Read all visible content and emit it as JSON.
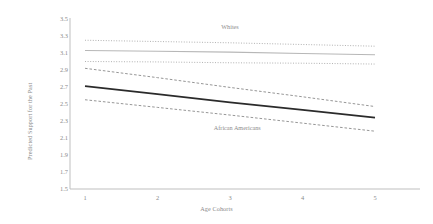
{
  "chart_data": {
    "type": "line",
    "title": "",
    "subtitle": "",
    "xlabel": "Age Cohorts",
    "ylabel": "Predicted Support for the Past",
    "x": [
      1,
      2,
      3,
      4,
      5
    ],
    "xtick_labels": [
      "1",
      "2",
      "3",
      "4",
      "5"
    ],
    "xlim": [
      0.6,
      5.4
    ],
    "ylim": [
      1.5,
      3.5
    ],
    "ytick_labels": [
      "3.5",
      "3.3",
      "3.1",
      "2.9",
      "2.7",
      "2.5",
      "2.3",
      "2.1",
      "1.9",
      "1.7",
      "1.5"
    ],
    "ytick_values": [
      3.5,
      3.3,
      3.1,
      2.9,
      2.7,
      2.5,
      2.3,
      2.1,
      1.9,
      1.7,
      1.5
    ],
    "grid": false,
    "legend_position": "inline-annotations",
    "series": [
      {
        "name": "Whites",
        "role": "fit",
        "style": "solid",
        "color": "#b7b7b7",
        "width": 1.1,
        "values": [
          3.13,
          3.12,
          3.11,
          3.095,
          3.08
        ]
      },
      {
        "name": "Whites CI upper",
        "role": "confidence-upper",
        "style": "dotted",
        "color": "#a8a8a8",
        "width": 0.9,
        "values": [
          3.25,
          3.235,
          3.22,
          3.2,
          3.18
        ]
      },
      {
        "name": "Whites CI lower",
        "role": "confidence-lower",
        "style": "dotted",
        "color": "#a8a8a8",
        "width": 0.9,
        "values": [
          3.0,
          2.995,
          2.985,
          2.98,
          2.97
        ]
      },
      {
        "name": "African Americans",
        "role": "fit",
        "style": "solid",
        "color": "#2b2b2b",
        "width": 1.8,
        "values": [
          2.71,
          2.615,
          2.52,
          2.43,
          2.34
        ]
      },
      {
        "name": "African Americans CI upper",
        "role": "confidence-upper",
        "style": "dashed",
        "color": "#909090",
        "width": 0.95,
        "values": [
          2.92,
          2.81,
          2.695,
          2.585,
          2.47
        ]
      },
      {
        "name": "African Americans CI lower",
        "role": "confidence-lower",
        "style": "dashed",
        "color": "#909090",
        "width": 0.95,
        "values": [
          2.55,
          2.46,
          2.37,
          2.275,
          2.18
        ]
      }
    ],
    "annotations": [
      {
        "text": "Whites",
        "x": 3.0,
        "y": 3.41
      },
      {
        "text": "African Americans",
        "x": 3.1,
        "y": 2.22
      }
    ],
    "colors": {
      "axis": "#bfbfbf",
      "text": "#8a8a8a",
      "whites_line": "#b7b7b7",
      "african_americans_line": "#2b2b2b",
      "background": "#ffffff"
    }
  }
}
